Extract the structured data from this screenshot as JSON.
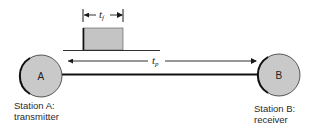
{
  "diagram": {
    "type": "propagation-delay-illustration",
    "stations": [
      {
        "id": "A",
        "letter": "A",
        "caption_line1": "Station A:",
        "caption_line2": "transmitter"
      },
      {
        "id": "B",
        "letter": "B",
        "caption_line1": "Station B:",
        "caption_line2": "receiver"
      }
    ],
    "labels": {
      "frame_time_symbol": "t",
      "frame_time_subscript": "f",
      "propagation_time_symbol": "t",
      "propagation_time_subscript": "p"
    },
    "colors": {
      "station_fill": "#c9c9c9",
      "pulse_fill": "#c4c4c4",
      "line": "#1a1a1a"
    }
  }
}
